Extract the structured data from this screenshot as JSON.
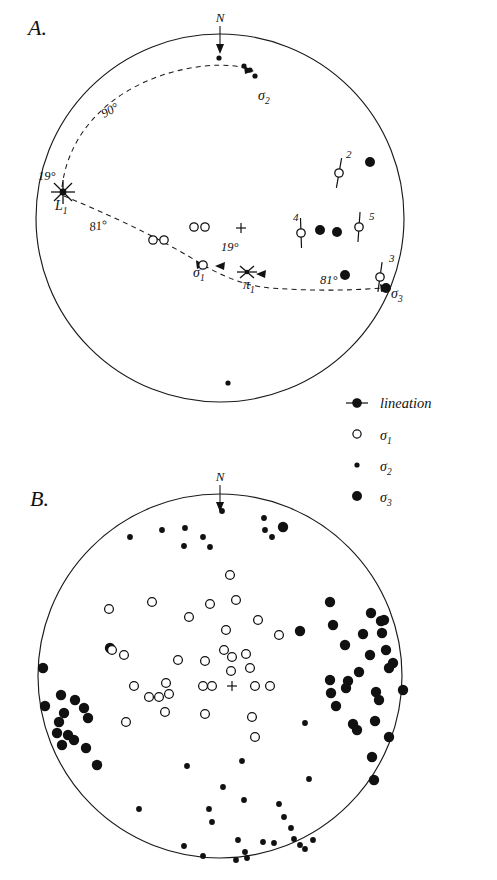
{
  "figure": {
    "type": "stereonet-pair",
    "background_color": "#ffffff",
    "ink_color": "#111111",
    "panels": [
      {
        "id": "A",
        "label": "A.",
        "label_x": 28,
        "label_y": 35,
        "cx": 220,
        "cy": 218,
        "r": 184
      },
      {
        "id": "B",
        "label": "B.",
        "label_x": 30,
        "label_y": 506,
        "cx": 220,
        "cy": 676,
        "r": 182
      }
    ]
  },
  "compass": {
    "north_label": "N",
    "panel_a": {
      "label_x": 220,
      "label_y": 22,
      "arrow_x": 220,
      "arrow_y1": 26,
      "arrow_y2": 50
    },
    "panel_b": {
      "label_x": 220,
      "label_y": 481,
      "arrow_x": 220,
      "arrow_y1": 485,
      "arrow_y2": 508
    }
  },
  "panel_a": {
    "center_cross": {
      "x": 241,
      "y": 228,
      "size": 5
    },
    "annotations": [
      {
        "name": "angle-90",
        "text": "90°",
        "x": 104,
        "y": 118,
        "rotate": -28
      },
      {
        "name": "angle-19-left",
        "text": "19°",
        "x": 38,
        "y": 180,
        "rotate": 0
      },
      {
        "name": "angle-81-left",
        "text": "81°",
        "x": 90,
        "y": 231,
        "rotate": -8
      },
      {
        "name": "angle-19-center",
        "text": "19°",
        "x": 221,
        "y": 251,
        "rotate": 0
      },
      {
        "name": "angle-81-right",
        "text": "81°",
        "x": 320,
        "y": 284,
        "rotate": 0
      }
    ],
    "axis_labels": [
      {
        "name": "label-L1",
        "base": "L",
        "sub": "1",
        "x": 55,
        "y": 210
      },
      {
        "name": "label-sigma1",
        "base": "σ",
        "sub": "1",
        "x": 193,
        "y": 277
      },
      {
        "name": "label-pi1",
        "base": "π",
        "sub": "1",
        "x": 243,
        "y": 289
      },
      {
        "name": "label-sigma2",
        "base": "σ",
        "sub": "2",
        "x": 258,
        "y": 100
      },
      {
        "name": "label-sigma3",
        "base": "σ",
        "sub": "3",
        "x": 391,
        "y": 298
      }
    ],
    "great_circle_90": {
      "description": "dashed girdle from L1 through north-east to sigma2",
      "path": "M 62 187 C 70 120, 130 74, 205 66 C 225 64, 240 66, 252 70"
    },
    "great_circle_81": {
      "description": "dashed girdle from L1 through sigma1 and pi1 to sigma3",
      "path": "M 64 196 C 110 215, 160 238, 203 265 C 232 281, 250 286, 270 288 C 310 291, 355 291, 392 287"
    },
    "markers": {
      "L1": {
        "x": 63,
        "y": 192,
        "type": "star"
      },
      "pi1": {
        "x": 247,
        "y": 272,
        "type": "star"
      },
      "sigma1_arrow": {
        "x": 203,
        "y": 265
      },
      "sigma2_arrow": {
        "x": 251,
        "y": 71
      },
      "sigma3_arrow": {
        "x": 389,
        "y": 288
      }
    },
    "sigma1_points": [
      {
        "x": 153,
        "y": 240
      },
      {
        "x": 164,
        "y": 240
      },
      {
        "x": 194,
        "y": 227
      },
      {
        "x": 205,
        "y": 227
      },
      {
        "x": 203,
        "y": 265
      }
    ],
    "sigma2_points": [
      {
        "x": 219,
        "y": 58
      },
      {
        "x": 250,
        "y": 70
      },
      {
        "x": 244,
        "y": 66
      },
      {
        "x": 255,
        "y": 76
      },
      {
        "x": 228,
        "y": 383
      }
    ],
    "sigma3_points": [
      {
        "x": 370,
        "y": 162
      },
      {
        "x": 320,
        "y": 230
      },
      {
        "x": 337,
        "y": 232
      },
      {
        "x": 345,
        "y": 275
      },
      {
        "x": 386,
        "y": 288
      }
    ],
    "lineations": [
      {
        "number": "2",
        "x": 339,
        "y": 173,
        "bar_angle": -10,
        "label_x": 346,
        "label_y": 158
      },
      {
        "number": "3",
        "x": 380,
        "y": 277,
        "bar_angle": -8,
        "label_x": 389,
        "label_y": 262
      },
      {
        "number": "4",
        "x": 301,
        "y": 233,
        "bar_angle": 2,
        "label_x": 293,
        "label_y": 221
      },
      {
        "number": "5",
        "x": 359,
        "y": 227,
        "bar_angle": -4,
        "label_x": 369,
        "label_y": 220
      }
    ]
  },
  "legend": {
    "x": 348,
    "items": [
      {
        "name": "legend-lineation",
        "symbol": "lineation",
        "label": "lineation",
        "sym_x": 356,
        "y": 403
      },
      {
        "name": "legend-sigma1",
        "symbol": "sigma1",
        "base": "σ",
        "sub": "1",
        "sym_x": 356,
        "y": 434
      },
      {
        "name": "legend-sigma2",
        "symbol": "sigma2",
        "base": "σ",
        "sub": "2",
        "sym_x": 356,
        "y": 465
      },
      {
        "name": "legend-sigma3",
        "symbol": "sigma3",
        "base": "σ",
        "sub": "3",
        "sym_x": 356,
        "y": 496
      }
    ],
    "text_x": 380
  },
  "panel_b": {
    "center_cross": {
      "x": 232,
      "y": 686,
      "size": 5
    },
    "sigma1_points": [
      {
        "x": 230,
        "y": 575
      },
      {
        "x": 236,
        "y": 600
      },
      {
        "x": 109,
        "y": 609
      },
      {
        "x": 152,
        "y": 602
      },
      {
        "x": 189,
        "y": 617
      },
      {
        "x": 210,
        "y": 604
      },
      {
        "x": 258,
        "y": 620
      },
      {
        "x": 226,
        "y": 630
      },
      {
        "x": 279,
        "y": 635
      },
      {
        "x": 224,
        "y": 650
      },
      {
        "x": 232,
        "y": 657
      },
      {
        "x": 246,
        "y": 654
      },
      {
        "x": 178,
        "y": 660
      },
      {
        "x": 205,
        "y": 661
      },
      {
        "x": 231,
        "y": 671
      },
      {
        "x": 250,
        "y": 668
      },
      {
        "x": 112,
        "y": 650
      },
      {
        "x": 124,
        "y": 655
      },
      {
        "x": 203,
        "y": 686
      },
      {
        "x": 212,
        "y": 686
      },
      {
        "x": 255,
        "y": 686
      },
      {
        "x": 270,
        "y": 686
      },
      {
        "x": 134,
        "y": 686
      },
      {
        "x": 166,
        "y": 683
      },
      {
        "x": 149,
        "y": 697
      },
      {
        "x": 159,
        "y": 697
      },
      {
        "x": 169,
        "y": 694
      },
      {
        "x": 165,
        "y": 712
      },
      {
        "x": 205,
        "y": 714
      },
      {
        "x": 126,
        "y": 722
      },
      {
        "x": 252,
        "y": 717
      },
      {
        "x": 255,
        "y": 737
      }
    ],
    "sigma2_points": [
      {
        "x": 222,
        "y": 511
      },
      {
        "x": 264,
        "y": 518
      },
      {
        "x": 162,
        "y": 530
      },
      {
        "x": 185,
        "y": 528
      },
      {
        "x": 130,
        "y": 537
      },
      {
        "x": 203,
        "y": 537
      },
      {
        "x": 265,
        "y": 530
      },
      {
        "x": 272,
        "y": 537
      },
      {
        "x": 184,
        "y": 546
      },
      {
        "x": 210,
        "y": 547
      },
      {
        "x": 305,
        "y": 723
      },
      {
        "x": 242,
        "y": 761
      },
      {
        "x": 187,
        "y": 766
      },
      {
        "x": 309,
        "y": 779
      },
      {
        "x": 223,
        "y": 787
      },
      {
        "x": 244,
        "y": 800
      },
      {
        "x": 139,
        "y": 809
      },
      {
        "x": 209,
        "y": 809
      },
      {
        "x": 279,
        "y": 804
      },
      {
        "x": 284,
        "y": 817
      },
      {
        "x": 212,
        "y": 822
      },
      {
        "x": 291,
        "y": 828
      },
      {
        "x": 294,
        "y": 839
      },
      {
        "x": 238,
        "y": 840
      },
      {
        "x": 263,
        "y": 842
      },
      {
        "x": 274,
        "y": 843
      },
      {
        "x": 184,
        "y": 846
      },
      {
        "x": 300,
        "y": 845
      },
      {
        "x": 305,
        "y": 849
      },
      {
        "x": 245,
        "y": 852
      },
      {
        "x": 313,
        "y": 840
      },
      {
        "x": 203,
        "y": 856
      },
      {
        "x": 247,
        "y": 858
      },
      {
        "x": 236,
        "y": 860
      }
    ],
    "sigma3_points": [
      {
        "x": 283,
        "y": 527
      },
      {
        "x": 330,
        "y": 602
      },
      {
        "x": 371,
        "y": 613
      },
      {
        "x": 384,
        "y": 620
      },
      {
        "x": 381,
        "y": 621
      },
      {
        "x": 300,
        "y": 631
      },
      {
        "x": 333,
        "y": 625
      },
      {
        "x": 363,
        "y": 634
      },
      {
        "x": 382,
        "y": 633
      },
      {
        "x": 110,
        "y": 648
      },
      {
        "x": 345,
        "y": 645
      },
      {
        "x": 386,
        "y": 650
      },
      {
        "x": 370,
        "y": 655
      },
      {
        "x": 393,
        "y": 663
      },
      {
        "x": 389,
        "y": 668
      },
      {
        "x": 43,
        "y": 668
      },
      {
        "x": 359,
        "y": 672
      },
      {
        "x": 330,
        "y": 680
      },
      {
        "x": 348,
        "y": 681
      },
      {
        "x": 346,
        "y": 688
      },
      {
        "x": 61,
        "y": 695
      },
      {
        "x": 75,
        "y": 700
      },
      {
        "x": 331,
        "y": 693
      },
      {
        "x": 376,
        "y": 692
      },
      {
        "x": 403,
        "y": 690
      },
      {
        "x": 45,
        "y": 706
      },
      {
        "x": 64,
        "y": 713
      },
      {
        "x": 84,
        "y": 708
      },
      {
        "x": 336,
        "y": 706
      },
      {
        "x": 379,
        "y": 700
      },
      {
        "x": 59,
        "y": 722
      },
      {
        "x": 88,
        "y": 718
      },
      {
        "x": 57,
        "y": 733
      },
      {
        "x": 68,
        "y": 735
      },
      {
        "x": 74,
        "y": 740
      },
      {
        "x": 353,
        "y": 724
      },
      {
        "x": 357,
        "y": 730
      },
      {
        "x": 375,
        "y": 721
      },
      {
        "x": 62,
        "y": 745
      },
      {
        "x": 86,
        "y": 748
      },
      {
        "x": 389,
        "y": 737
      },
      {
        "x": 97,
        "y": 765
      },
      {
        "x": 372,
        "y": 757
      },
      {
        "x": 374,
        "y": 780
      }
    ]
  }
}
